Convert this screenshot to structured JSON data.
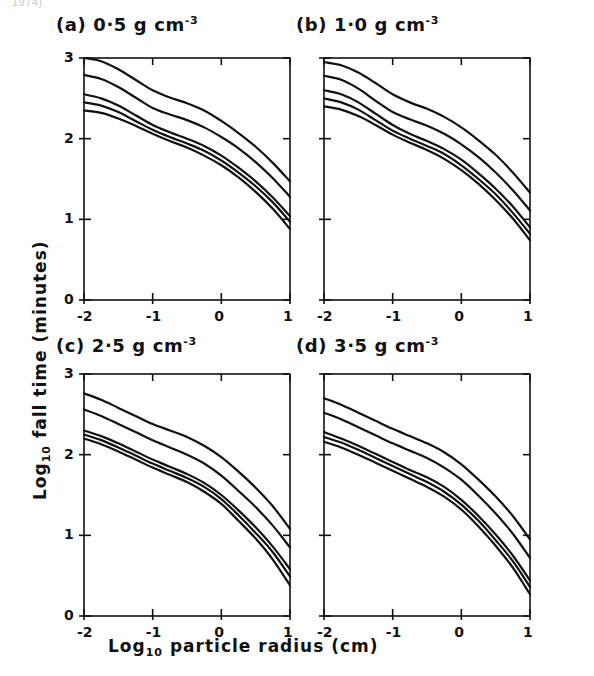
{
  "figure": {
    "clipped_header": "1974)",
    "xlabel_main": "Log",
    "xlabel_sub": "10",
    "xlabel_rest": " particle radius  (cm)",
    "ylabel_main": "Log",
    "ylabel_sub": "10",
    "ylabel_rest": " fall time  (minutes)"
  },
  "chart_data": [
    {
      "type": "line",
      "panel": "a",
      "title_prefix": "(a)",
      "title_value": "0·5",
      "title_unit": "g cm",
      "title_exponent": "-3",
      "xlabel": "Log10 particle radius (cm)",
      "ylabel": "Log10 fall time (minutes)",
      "xlim": [
        -2,
        1
      ],
      "ylim": [
        0,
        3
      ],
      "xticks": [
        -2,
        -1,
        0,
        1
      ],
      "xticklabels": [
        "-2",
        "-1",
        "0",
        "1"
      ],
      "yticks": [
        0,
        1,
        2,
        3
      ],
      "yticklabels": [
        "0",
        "1",
        "2",
        "3"
      ],
      "grid": false,
      "legend": "none",
      "x": [
        -2.0,
        -1.75,
        -1.5,
        -1.25,
        -1.0,
        -0.75,
        -0.5,
        -0.25,
        0.0,
        0.25,
        0.5,
        0.75,
        1.0
      ],
      "series": [
        {
          "name": "curve-1",
          "values": [
            3.0,
            2.96,
            2.86,
            2.73,
            2.6,
            2.51,
            2.44,
            2.35,
            2.22,
            2.07,
            1.9,
            1.7,
            1.47
          ]
        },
        {
          "name": "curve-2",
          "values": [
            2.79,
            2.74,
            2.64,
            2.51,
            2.38,
            2.3,
            2.23,
            2.14,
            2.02,
            1.88,
            1.71,
            1.51,
            1.28
          ]
        },
        {
          "name": "curve-3",
          "values": [
            2.55,
            2.5,
            2.41,
            2.29,
            2.17,
            2.08,
            2.0,
            1.91,
            1.79,
            1.64,
            1.47,
            1.27,
            1.04
          ]
        },
        {
          "name": "curve-4",
          "values": [
            2.45,
            2.41,
            2.33,
            2.22,
            2.11,
            2.02,
            1.94,
            1.85,
            1.73,
            1.58,
            1.41,
            1.21,
            0.97
          ]
        },
        {
          "name": "curve-5",
          "values": [
            2.35,
            2.32,
            2.25,
            2.16,
            2.06,
            1.97,
            1.89,
            1.79,
            1.67,
            1.52,
            1.34,
            1.13,
            0.88
          ]
        }
      ]
    },
    {
      "type": "line",
      "panel": "b",
      "title_prefix": "(b)",
      "title_value": "1·0",
      "title_unit": "g cm",
      "title_exponent": "-3",
      "xlabel": "Log10 particle radius (cm)",
      "ylabel": "Log10 fall time (minutes)",
      "xlim": [
        -2,
        1
      ],
      "ylim": [
        0,
        3
      ],
      "xticks": [
        -2,
        -1,
        0,
        1
      ],
      "xticklabels": [
        "-2",
        "-1",
        "0",
        "1"
      ],
      "yticks": [
        0,
        1,
        2,
        3
      ],
      "yticklabels": [
        "0",
        "1",
        "2",
        "3"
      ],
      "grid": false,
      "legend": "none",
      "x": [
        -2.0,
        -1.75,
        -1.5,
        -1.25,
        -1.0,
        -0.75,
        -0.5,
        -0.25,
        0.0,
        0.25,
        0.5,
        0.75,
        1.0
      ],
      "series": [
        {
          "name": "curve-1",
          "values": [
            2.95,
            2.91,
            2.82,
            2.69,
            2.55,
            2.45,
            2.37,
            2.27,
            2.14,
            1.98,
            1.8,
            1.58,
            1.33
          ]
        },
        {
          "name": "curve-2",
          "values": [
            2.78,
            2.73,
            2.62,
            2.47,
            2.33,
            2.24,
            2.16,
            2.06,
            1.93,
            1.77,
            1.58,
            1.36,
            1.11
          ]
        },
        {
          "name": "curve-3",
          "values": [
            2.6,
            2.55,
            2.45,
            2.31,
            2.17,
            2.06,
            1.97,
            1.87,
            1.74,
            1.57,
            1.38,
            1.16,
            0.9
          ]
        },
        {
          "name": "curve-4",
          "values": [
            2.5,
            2.45,
            2.36,
            2.23,
            2.1,
            2.0,
            1.91,
            1.81,
            1.67,
            1.5,
            1.31,
            1.08,
            0.82
          ]
        },
        {
          "name": "curve-5",
          "values": [
            2.4,
            2.36,
            2.28,
            2.17,
            2.05,
            1.95,
            1.86,
            1.75,
            1.61,
            1.44,
            1.24,
            1.01,
            0.74
          ]
        }
      ]
    },
    {
      "type": "line",
      "panel": "c",
      "title_prefix": "(c)",
      "title_value": "2·5",
      "title_unit": "g cm",
      "title_exponent": "-3",
      "xlabel": "Log10 particle radius (cm)",
      "ylabel": "Log10 fall time (minutes)",
      "xlim": [
        -2,
        1
      ],
      "ylim": [
        0,
        3
      ],
      "xticks": [
        -2,
        -1,
        0,
        1
      ],
      "xticklabels": [
        "-2",
        "-1",
        "0",
        "1"
      ],
      "yticks": [
        0,
        1,
        2,
        3
      ],
      "yticklabels": [
        "0",
        "1",
        "2",
        "3"
      ],
      "grid": false,
      "legend": "none",
      "x": [
        -2.0,
        -1.75,
        -1.5,
        -1.25,
        -1.0,
        -0.75,
        -0.5,
        -0.25,
        0.0,
        0.25,
        0.5,
        0.75,
        1.0
      ],
      "series": [
        {
          "name": "curve-1",
          "values": [
            2.76,
            2.68,
            2.58,
            2.48,
            2.38,
            2.3,
            2.22,
            2.11,
            1.97,
            1.79,
            1.59,
            1.36,
            1.08
          ]
        },
        {
          "name": "curve-2",
          "values": [
            2.56,
            2.48,
            2.38,
            2.28,
            2.18,
            2.09,
            2.0,
            1.89,
            1.74,
            1.55,
            1.35,
            1.12,
            0.85
          ]
        },
        {
          "name": "curve-3",
          "values": [
            2.3,
            2.23,
            2.14,
            2.04,
            1.94,
            1.85,
            1.76,
            1.65,
            1.5,
            1.31,
            1.1,
            0.86,
            0.58
          ]
        },
        {
          "name": "curve-4",
          "values": [
            2.25,
            2.18,
            2.09,
            1.99,
            1.89,
            1.8,
            1.71,
            1.6,
            1.45,
            1.25,
            1.03,
            0.79,
            0.49
          ]
        },
        {
          "name": "curve-5",
          "values": [
            2.2,
            2.13,
            2.04,
            1.94,
            1.84,
            1.75,
            1.66,
            1.54,
            1.39,
            1.18,
            0.96,
            0.7,
            0.38
          ]
        }
      ]
    },
    {
      "type": "line",
      "panel": "d",
      "title_prefix": "(d)",
      "title_value": "3·5",
      "title_unit": "g cm",
      "title_exponent": "-3",
      "xlabel": "Log10 particle radius (cm)",
      "ylabel": "Log10 fall time (minutes)",
      "xlim": [
        -2,
        1
      ],
      "ylim": [
        0,
        3
      ],
      "xticks": [
        -2,
        -1,
        0,
        1
      ],
      "xticklabels": [
        "-2",
        "-1",
        "0",
        "1"
      ],
      "yticks": [
        0,
        1,
        2,
        3
      ],
      "yticklabels": [
        "0",
        "1",
        "2",
        "3"
      ],
      "grid": false,
      "legend": "none",
      "x": [
        -2.0,
        -1.75,
        -1.5,
        -1.25,
        -1.0,
        -0.75,
        -0.5,
        -0.25,
        0.0,
        0.25,
        0.5,
        0.75,
        1.0
      ],
      "series": [
        {
          "name": "curve-1",
          "values": [
            2.7,
            2.62,
            2.52,
            2.42,
            2.32,
            2.23,
            2.14,
            2.03,
            1.88,
            1.69,
            1.48,
            1.24,
            0.95
          ]
        },
        {
          "name": "curve-2",
          "values": [
            2.52,
            2.44,
            2.34,
            2.24,
            2.14,
            2.05,
            1.96,
            1.84,
            1.69,
            1.49,
            1.27,
            1.02,
            0.72
          ]
        },
        {
          "name": "curve-3",
          "values": [
            2.28,
            2.2,
            2.11,
            2.01,
            1.91,
            1.81,
            1.72,
            1.6,
            1.44,
            1.24,
            1.01,
            0.75,
            0.44
          ]
        },
        {
          "name": "curve-4",
          "values": [
            2.22,
            2.15,
            2.06,
            1.96,
            1.86,
            1.76,
            1.66,
            1.54,
            1.38,
            1.18,
            0.94,
            0.68,
            0.36
          ]
        },
        {
          "name": "curve-5",
          "values": [
            2.16,
            2.09,
            2.0,
            1.9,
            1.8,
            1.7,
            1.6,
            1.48,
            1.32,
            1.11,
            0.87,
            0.6,
            0.27
          ]
        }
      ]
    }
  ]
}
